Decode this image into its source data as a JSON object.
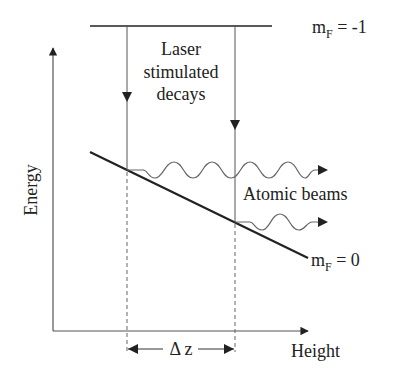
{
  "diagram": {
    "type": "energy-level diagram",
    "axes": {
      "y_label": "Energy",
      "x_label": "Height"
    },
    "upper_level": {
      "label_m": "m",
      "label_sub": "F",
      "label_rest": " = -1"
    },
    "lower_level": {
      "label_m": "m",
      "label_sub": "F",
      "label_rest": " = 0"
    },
    "annotations": {
      "laser_line1": "Laser",
      "laser_line2": "stimulated",
      "laser_line3": "decays",
      "atomic_beams": "Atomic beams",
      "delta_z": "Δ z"
    },
    "colors": {
      "ink": "#222222",
      "thin": "#555555",
      "background": "#ffffff"
    }
  }
}
